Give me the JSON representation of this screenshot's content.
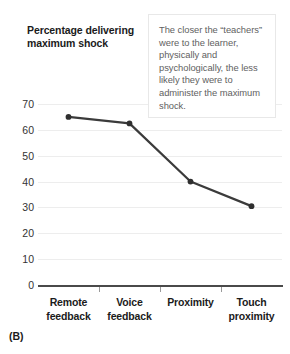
{
  "panel": {
    "label": "(B)"
  },
  "annotation": {
    "text": "The closer the “teachers” were to the learner, physically and psychologically, the less likely they were to administer the maximum shock."
  },
  "colors": {
    "line": "#3b3b3b",
    "marker": "#2f2f2f",
    "gridline": "#ededed",
    "axis": "#4a4a4a",
    "annotation_border": "#e8e8e8",
    "annotation_text": "#616161",
    "title_text": "#1b1b1b"
  },
  "chart_data": {
    "type": "line",
    "title": "Percentage delivering maximum shock",
    "xlabel": "",
    "ylabel": "Percentage delivering maximum shock",
    "categories": [
      "Remote feedback",
      "Voice feedback",
      "Proximity",
      "Touch proximity"
    ],
    "category_lines": [
      [
        "Remote",
        "feedback"
      ],
      [
        "Voice",
        "feedback"
      ],
      [
        "Proximity",
        ""
      ],
      [
        "Touch",
        "proximity"
      ]
    ],
    "values": [
      65,
      62.5,
      40,
      30.5
    ],
    "ylim": [
      0,
      70
    ],
    "yticks": [
      0,
      10,
      20,
      30,
      40,
      50,
      60,
      70
    ],
    "ytick_labels": [
      "0",
      "10",
      "20",
      "30",
      "40",
      "50",
      "60",
      "70"
    ],
    "grid": true,
    "legend": false,
    "annotations": [
      {
        "text": "The closer the “teachers” were to the learner, physically and psychologically, the less likely they were to administer the maximum shock.",
        "position": "top-right"
      }
    ]
  }
}
